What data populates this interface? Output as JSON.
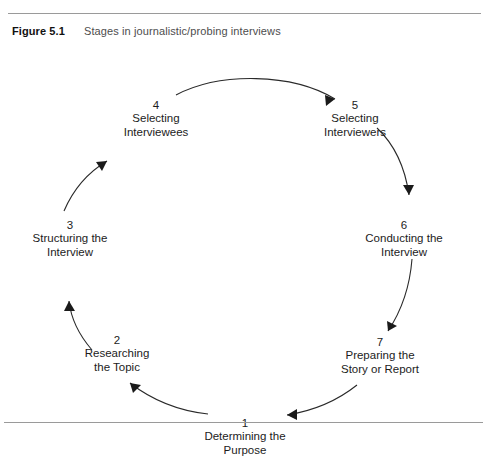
{
  "figure": {
    "label": "Figure 5.1",
    "caption": "Stages in journalistic/probing interviews"
  },
  "diagram": {
    "type": "cycle",
    "direction": "clockwise",
    "stage_count": 7,
    "stages": [
      {
        "number": "1",
        "line1": "Determining the",
        "line2": "Purpose"
      },
      {
        "number": "2",
        "line1": "Researching",
        "line2": "the Topic"
      },
      {
        "number": "3",
        "line1": "Structuring the",
        "line2": "Interview"
      },
      {
        "number": "4",
        "line1": "Selecting",
        "line2": "Interviewees"
      },
      {
        "number": "5",
        "line1": "Selecting",
        "line2": "Interviewers"
      },
      {
        "number": "6",
        "line1": "Conducting the",
        "line2": "Interview"
      },
      {
        "number": "7",
        "line1": "Preparing the",
        "line2": "Story or Report"
      }
    ]
  },
  "colors": {
    "rule": "#9a9a9a",
    "arrow": "#1a1a1a",
    "caption_label": "#111111",
    "caption_text": "#4d4d4d",
    "background": "#ffffff"
  }
}
